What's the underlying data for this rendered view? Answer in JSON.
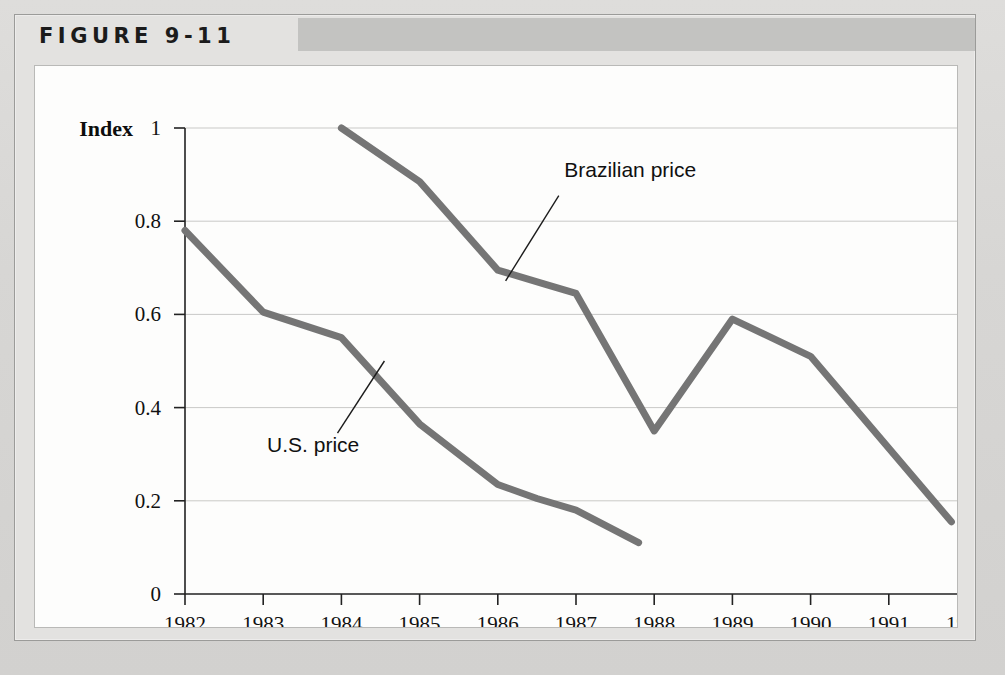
{
  "figure": {
    "label": "FIGURE 9-11"
  },
  "chart_data": {
    "type": "line",
    "title": "",
    "xlabel": "",
    "ylabel": "Index",
    "ylim": [
      0,
      1
    ],
    "xlim": [
      1982,
      1992
    ],
    "grid": true,
    "legend": "annotations",
    "ytick_labels": [
      "1",
      "0.8",
      "0.6",
      "0.4",
      "0.2",
      "0"
    ],
    "ytick_values": [
      1,
      0.8,
      0.6,
      0.4,
      0.2,
      0
    ],
    "categories": [
      1982,
      1983,
      1984,
      1985,
      1986,
      1987,
      1988,
      1989,
      1990,
      1991,
      1992
    ],
    "xtick_labels": [
      "1982",
      "1983",
      "1984",
      "1985",
      "1986",
      "1987",
      "1988",
      "1989",
      "1990",
      "1991",
      "1992"
    ],
    "series": [
      {
        "name": "U.S. price",
        "color": "#757575",
        "x": [
          1982,
          1983,
          1984,
          1985,
          1986,
          1986.5,
          1987,
          1987.8
        ],
        "values": [
          0.78,
          0.605,
          0.55,
          0.365,
          0.235,
          0.205,
          0.18,
          0.11
        ]
      },
      {
        "name": "Brazilian price",
        "color": "#757575",
        "x": [
          1984,
          1985,
          1986,
          1986.6,
          1987,
          1988,
          1989,
          1990,
          1991.8
        ],
        "values": [
          1.0,
          0.885,
          0.695,
          0.665,
          0.645,
          0.35,
          0.59,
          0.51,
          0.155
        ]
      }
    ],
    "annotations": [
      {
        "text": "Brazilian price",
        "x": 1986.85,
        "y": 0.895
      },
      {
        "text": "U.S. price",
        "x": 1983.05,
        "y": 0.305
      }
    ]
  }
}
